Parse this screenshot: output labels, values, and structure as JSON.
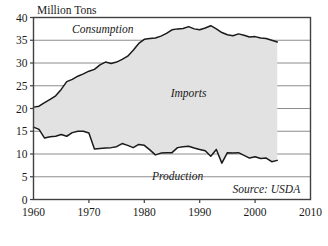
{
  "chart_data": {
    "type": "area",
    "title": "",
    "subtitle": "",
    "xlabel": "",
    "ylabel": "Million Tons",
    "xlim": [
      1960,
      2010
    ],
    "ylim": [
      0,
      40
    ],
    "xticks": [
      1960,
      1970,
      1980,
      1990,
      2000,
      2010
    ],
    "xtick_labels": [
      "1960",
      "1970",
      "1980",
      "1990",
      "2000",
      "2010"
    ],
    "yticks": [
      0,
      5,
      10,
      15,
      20,
      25,
      30,
      35,
      40
    ],
    "ytick_labels": [
      "0",
      "5",
      "10",
      "15",
      "20",
      "25",
      "30",
      "35",
      "40"
    ],
    "grid": "horizontal",
    "legend_position": "inline-annotations",
    "annotations": [
      {
        "text": "Consumption",
        "x": 1972.5,
        "y": 36.6,
        "style": "italic"
      },
      {
        "text": "Imports",
        "x": 1988.0,
        "y": 22.6,
        "style": "italic"
      },
      {
        "text": "Production",
        "x": 1986.0,
        "y": 4.3,
        "style": "italic"
      },
      {
        "text": "Source: USDA",
        "x": 2002.0,
        "y": 1.4,
        "style": "italic"
      }
    ],
    "fill_label": "Imports",
    "fill_color": "#e2e2e2",
    "line_color": "#1a1a1a",
    "grid_color": "#808080",
    "axis_color": "#404040",
    "x": [
      1960,
      1961,
      1962,
      1963,
      1964,
      1965,
      1966,
      1967,
      1968,
      1969,
      1970,
      1971,
      1972,
      1973,
      1974,
      1975,
      1976,
      1977,
      1978,
      1979,
      1980,
      1981,
      1982,
      1983,
      1984,
      1985,
      1986,
      1987,
      1988,
      1989,
      1990,
      1991,
      1992,
      1993,
      1994,
      1995,
      1996,
      1997,
      1998,
      1999,
      2000,
      2001,
      2002,
      2003,
      2004
    ],
    "series": [
      {
        "name": "Consumption",
        "values": [
          20.3,
          20.5,
          21.3,
          22.0,
          22.8,
          24.2,
          25.9,
          26.4,
          27.1,
          27.6,
          28.2,
          28.6,
          29.6,
          30.2,
          29.9,
          30.2,
          30.8,
          31.5,
          32.8,
          34.3,
          35.2,
          35.4,
          35.5,
          35.9,
          36.5,
          37.3,
          37.5,
          37.6,
          38.0,
          37.5,
          37.3,
          37.7,
          38.2,
          37.5,
          36.7,
          36.2,
          36.0,
          36.4,
          36.1,
          35.7,
          35.8,
          35.5,
          35.4,
          35.0,
          34.6
        ]
      },
      {
        "name": "Production",
        "values": [
          15.9,
          15.4,
          13.5,
          13.8,
          13.9,
          14.3,
          13.9,
          14.7,
          15.0,
          15.0,
          14.6,
          11.1,
          11.2,
          11.3,
          11.4,
          11.6,
          12.3,
          11.9,
          11.4,
          12.1,
          11.9,
          10.9,
          9.8,
          10.2,
          10.3,
          10.3,
          11.4,
          11.6,
          11.7,
          11.3,
          11.0,
          10.7,
          9.5,
          11.0,
          8.0,
          10.3,
          10.2,
          10.3,
          9.7,
          9.1,
          9.4,
          9.0,
          9.1,
          8.3,
          8.6
        ]
      }
    ]
  },
  "chart_meta": {
    "y_axis_title": "Million Tons",
    "source_note": "Source: USDA"
  }
}
